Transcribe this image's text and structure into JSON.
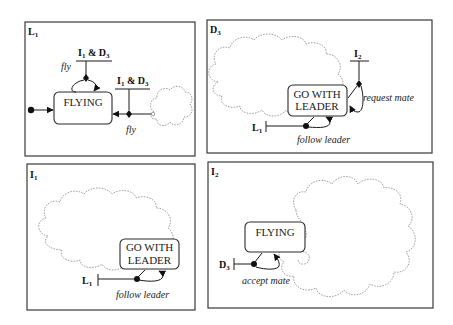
{
  "panels": [
    {
      "id": "L1",
      "label": "L",
      "label_sub": "1",
      "state": "FLYING",
      "guards": [
        {
          "text_a": "I",
          "sub_a": "1",
          "amp": " & ",
          "text_b": "D",
          "sub_b": "3"
        },
        {
          "text_a": "I",
          "sub_a": "1",
          "amp": " & ",
          "text_b": "D",
          "sub_b": "3"
        }
      ],
      "events": [
        "fly",
        "fly"
      ]
    },
    {
      "id": "D3",
      "label": "D",
      "label_sub": "3",
      "state_line1": "GO WITH",
      "state_line2": "LEADER",
      "guards": [
        {
          "text": "I",
          "sub": "2"
        },
        {
          "text": "L",
          "sub": "1"
        }
      ],
      "events": [
        "request mate",
        "follow leader"
      ]
    },
    {
      "id": "I1",
      "label": "I",
      "label_sub": "1",
      "state_line1": "GO WITH",
      "state_line2": "LEADER",
      "guards": [
        {
          "text": "L",
          "sub": "1"
        }
      ],
      "events": [
        "follow leader"
      ]
    },
    {
      "id": "I2",
      "label": "I",
      "label_sub": "2",
      "state": "FLYING",
      "guards": [
        {
          "text": "D",
          "sub": "3"
        }
      ],
      "events": [
        "accept mate"
      ]
    }
  ]
}
